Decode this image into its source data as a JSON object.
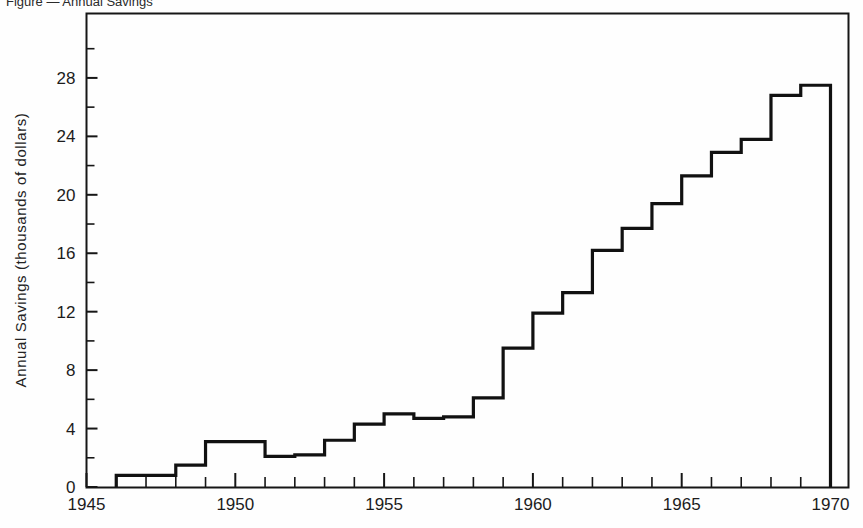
{
  "caption": {
    "text": "Figure — Annual Savings"
  },
  "chart_data": {
    "type": "line",
    "variant": "step",
    "title": "",
    "subtitle": "",
    "xlabel": "",
    "ylabel": "Annual Savings (thousands of dollars)",
    "xlim": [
      1945,
      1970.5
    ],
    "ylim": [
      0,
      30.5
    ],
    "grid": false,
    "legend": null,
    "x_major_tick_labels": [
      "1945",
      "1950",
      "1955",
      "1960",
      "1965",
      "1970"
    ],
    "x_major_tick_values": [
      1945,
      1950,
      1955,
      1960,
      1965,
      1970
    ],
    "x_minor_tick_step": 1,
    "y_major_tick_labels": [
      "0",
      "4",
      "8",
      "12",
      "16",
      "20",
      "24",
      "28"
    ],
    "y_major_tick_values": [
      0,
      4,
      8,
      12,
      16,
      20,
      24,
      28
    ],
    "y_minor_tick_step": 2,
    "x": [
      1946,
      1947,
      1948,
      1949,
      1950,
      1951,
      1952,
      1953,
      1954,
      1955,
      1956,
      1957,
      1958,
      1959,
      1960,
      1961,
      1962,
      1963,
      1964,
      1965,
      1966,
      1967,
      1968,
      1969
    ],
    "values": [
      0.8,
      0.8,
      1.5,
      3.1,
      3.1,
      2.1,
      2.2,
      3.2,
      4.3,
      5.0,
      4.7,
      4.8,
      6.1,
      9.5,
      11.9,
      13.3,
      16.2,
      17.7,
      19.4,
      21.3,
      22.9,
      23.8,
      26.8,
      27.5
    ],
    "series": [
      {
        "name": "Annual Savings",
        "values": [
          0.8,
          0.8,
          1.5,
          3.1,
          3.1,
          2.1,
          2.2,
          3.2,
          4.3,
          5.0,
          4.7,
          4.8,
          6.1,
          9.5,
          11.9,
          13.3,
          16.2,
          17.7,
          19.4,
          21.3,
          22.9,
          23.8,
          26.8,
          27.5
        ],
        "color": "#111111"
      }
    ],
    "step_start_year": 1946,
    "step_end_year": 1969,
    "drop_to_zero_at": 1969.1,
    "line_color": "#111111",
    "line_width": 3.2
  },
  "frame": {
    "border_color": "#161616"
  }
}
